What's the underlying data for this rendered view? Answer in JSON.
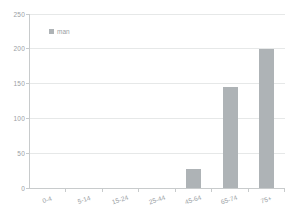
{
  "chart_data": {
    "type": "bar",
    "title": "",
    "xlabel": "",
    "ylabel": "",
    "categories": [
      "0-4",
      "5-14",
      "15-24",
      "25-44",
      "45-64",
      "65-74",
      "75+"
    ],
    "series": [
      {
        "name": "man",
        "values": [
          0,
          0,
          0,
          0,
          28,
          145,
          200
        ]
      }
    ],
    "ylim": [
      0,
      250
    ],
    "yticks": [
      0,
      50,
      100,
      150,
      200,
      250
    ],
    "grid": true,
    "legend_position": "top-left-inside",
    "colors": {
      "bar": "#aeb3b6",
      "grid": "#e6e8e8",
      "axis": "#c8cbcc",
      "text": "#9aa0a4",
      "background": "#ffffff"
    }
  }
}
